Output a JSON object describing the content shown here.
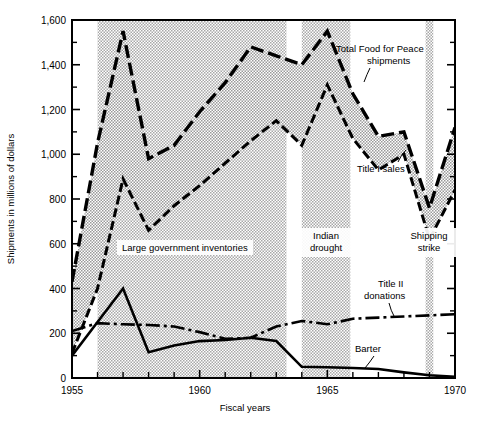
{
  "chart_data": {
    "type": "line",
    "title": "",
    "xlabel": "Fiscal years",
    "ylabel": "Shipments in millions of dollars",
    "xlim": [
      1955,
      1970
    ],
    "ylim": [
      0,
      1600
    ],
    "grid": false,
    "legend_position": "inline-annotations",
    "x_ticks": [
      1955,
      1960,
      1965,
      1970
    ],
    "x_tick_labels": [
      "1955",
      "1960",
      "1965",
      "1970"
    ],
    "x_minor_ticks": [
      1956,
      1957,
      1958,
      1959,
      1961,
      1962,
      1963,
      1964,
      1966,
      1967,
      1968,
      1969
    ],
    "y_ticks": [
      0,
      200,
      400,
      600,
      800,
      1000,
      1200,
      1400,
      1600
    ],
    "y_tick_labels": [
      "0",
      "200",
      "400",
      "600",
      "800",
      "1,000",
      "1,200",
      "1,400",
      "1,600"
    ],
    "y_minor_ticks": [
      100,
      300,
      500,
      700,
      900,
      1100,
      1300,
      1500
    ],
    "x": [
      1955,
      1956,
      1957,
      1958,
      1959,
      1960,
      1961,
      1962,
      1963,
      1964,
      1965,
      1966,
      1967,
      1968,
      1969,
      1970
    ],
    "series": [
      {
        "name": "Total Food for Peace shipments",
        "style": "long-dash",
        "values": [
          430,
          1050,
          1550,
          980,
          1040,
          1190,
          1320,
          1480,
          1440,
          1400,
          1550,
          1270,
          1080,
          1100,
          760,
          1120
        ]
      },
      {
        "name": "Title I sales",
        "style": "dash-dot-dense",
        "values": [
          110,
          400,
          890,
          660,
          770,
          860,
          960,
          1060,
          1150,
          1040,
          1310,
          1070,
          930,
          1000,
          620,
          840
        ]
      },
      {
        "name": "Title II donations",
        "style": "dash-dot",
        "values": [
          210,
          245,
          240,
          237,
          230,
          205,
          175,
          180,
          230,
          255,
          240,
          265,
          270,
          275,
          280,
          285
        ]
      },
      {
        "name": "Barter",
        "style": "solid",
        "values": [
          100,
          250,
          400,
          115,
          145,
          165,
          170,
          180,
          165,
          50,
          48,
          45,
          40,
          25,
          12,
          5
        ]
      }
    ],
    "shaded_bands": [
      {
        "label": "Large government inventories",
        "start": 1956.0,
        "end": 1963.4
      },
      {
        "label": "Indian drought",
        "start": 1964.0,
        "end": 1965.9
      },
      {
        "label": "Shipping strike",
        "start": 1968.85,
        "end": 1969.15
      }
    ],
    "annotations": [
      {
        "name": "total-food-for-peace-label",
        "text_line1": "Total Food for Peace",
        "text_line2": "shipments"
      },
      {
        "name": "title-i-sales-label",
        "text_line1": "Title I sales",
        "text_line2": ""
      },
      {
        "name": "title-ii-donations-label",
        "text_line1": "Title II",
        "text_line2": "donations"
      },
      {
        "name": "barter-label",
        "text_line1": "Barter",
        "text_line2": ""
      },
      {
        "name": "large-government-inventories-label",
        "text_line1": "Large government inventories",
        "text_line2": ""
      },
      {
        "name": "indian-drought-label",
        "text_line1": "Indian",
        "text_line2": "drought"
      },
      {
        "name": "shipping-strike-label",
        "text_line1": "Shipping",
        "text_line2": "strike"
      }
    ]
  }
}
